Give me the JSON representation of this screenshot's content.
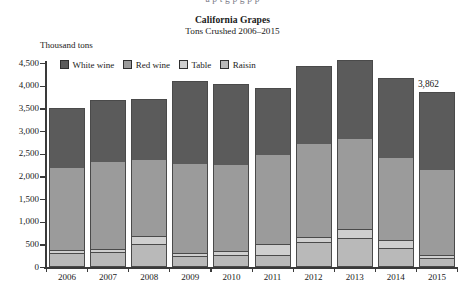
{
  "page": {
    "cut_text": "a   p      t         g             p        g  p  p"
  },
  "chart_data": {
    "type": "bar",
    "title": "California Grapes",
    "subtitle": "Tons Crushed 2006–2015",
    "ylabel": "Thousand tons",
    "xlabel": "",
    "stacked": true,
    "grid": false,
    "legend_position": "top-left",
    "ylim": [
      0,
      4500
    ],
    "ytick_step": 500,
    "yticks": [
      "0",
      "500",
      "1,000",
      "1,500",
      "2,000",
      "2,500",
      "3,000",
      "3,500",
      "4,000",
      "4,500"
    ],
    "categories": [
      "2006",
      "2007",
      "2008",
      "2009",
      "2010",
      "2011",
      "2012",
      "2013",
      "2014",
      "2015"
    ],
    "series": [
      {
        "name": "Raisin",
        "color": "#b9b9b9",
        "values": [
          280,
          300,
          480,
          215,
          250,
          240,
          520,
          620,
          400,
          180
        ]
      },
      {
        "name": "Table",
        "color": "#cfcfcf",
        "values": [
          70,
          75,
          190,
          75,
          80,
          240,
          115,
          200,
          175,
          60
        ]
      },
      {
        "name": "Red wine",
        "color": "#9b9b9b",
        "values": [
          1835,
          1940,
          1680,
          1990,
          1930,
          1995,
          2075,
          2005,
          1840,
          1900
        ]
      },
      {
        "name": "White wine",
        "color": "#5b5b5b",
        "values": [
          1315,
          1375,
          1350,
          1820,
          1770,
          1485,
          1720,
          1735,
          1745,
          1722
        ]
      }
    ],
    "totals": [
      3500,
      3690,
      3700,
      4100,
      4030,
      3960,
      4430,
      4560,
      4160,
      3862
    ],
    "annotations": [
      {
        "label": "3,862",
        "category": "2015"
      }
    ]
  }
}
